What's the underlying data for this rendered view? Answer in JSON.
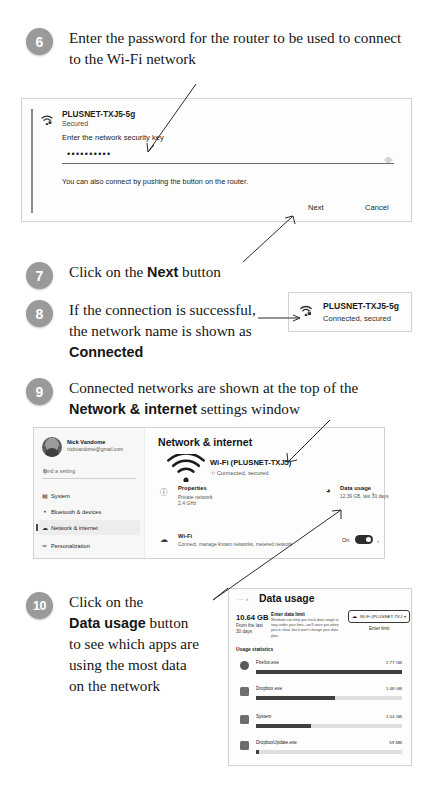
{
  "steps": [
    {
      "num": "6",
      "html_parts": [
        "Enter the password for the router to be used to connect to the Wi-Fi network"
      ]
    },
    {
      "num": "7",
      "pre": "Click on the ",
      "bold": "Next",
      "post": " button"
    },
    {
      "num": "8",
      "line1": "If the connection is successful,",
      "line2": "the network name is shown as",
      "bold": "Connected"
    },
    {
      "num": "9",
      "pre": "Connected networks are shown at the top of the ",
      "bold": "Network & internet",
      "post": " settings window"
    },
    {
      "num": "10",
      "l1": "Click on the",
      "bold": "Data usage",
      "boldpost": " button",
      "l3": "to see which apps are",
      "l4": "using the most data",
      "l5": "on the network"
    }
  ],
  "wifi_password_dialog": {
    "ssid": "PLUSNET-TXJ5-5g",
    "security": "Secured",
    "prompt": "Enter the network security key",
    "password_masked": "••••••••••",
    "reveal_icon": "eye-icon",
    "hint": "You can also connect by pushing the button on the router.",
    "next_label": "Next",
    "cancel_label": "Cancel"
  },
  "connected_chip": {
    "ssid": "PLUSNET-TXJ5-5g",
    "status": "Connected, secured"
  },
  "settings_window": {
    "account": {
      "name": "Nick Vandome",
      "email": "nickvandome@gmail.com"
    },
    "search_placeholder": "Find a setting",
    "nav": [
      {
        "label": "System",
        "icon": "monitor-icon",
        "selected": false
      },
      {
        "label": "Bluetooth & devices",
        "icon": "bluetooth-icon",
        "selected": false
      },
      {
        "label": "Network & internet",
        "icon": "wifi-icon",
        "selected": true
      },
      {
        "label": "Personalization",
        "icon": "brush-icon",
        "selected": false
      }
    ],
    "title": "Network & internet",
    "network": {
      "name": "Wi-Fi (PLUSNET-TXJ5)",
      "status": "Connected, secured"
    },
    "properties": {
      "title": "Properties",
      "line1": "Private network",
      "line2": "2.4 GHz",
      "chevron": "›"
    },
    "data_usage": {
      "title": "Data usage",
      "subtitle": "12.39 GB, last 30 days",
      "chevron": "›"
    },
    "wifi_row": {
      "title": "Wi-Fi",
      "subtitle": "Connect, manage known networks, metered network",
      "toggle_label": "On",
      "toggle_state": "on",
      "chevron": "›"
    }
  },
  "data_usage_window": {
    "breadcrumb": "···  ›",
    "title": "Data usage",
    "total": "10.64 GB",
    "period_line1": "From the last",
    "period_line2": "30 days",
    "limit_title": "Enter data limit",
    "limit_text": "Windows can help you track data usage to stay under your limit—we'll warn you when you're close, but it won't change your data plan.",
    "adapter_dropdown": "Wi-Fi (PLUSNET-TXJ",
    "adapter_icon": "wifi-icon",
    "enter_limit_label": "Enter limit",
    "usage_header": "Usage statistics",
    "apps": [
      {
        "name": "Firefox.exe",
        "value": "2.77 GB",
        "pct": 100,
        "icon": "firefox-icon"
      },
      {
        "name": "Dropbox.exe",
        "value": "1.48 GB",
        "pct": 54,
        "icon": "dropbox-icon"
      },
      {
        "name": "System",
        "value": "1.04 GB",
        "pct": 38,
        "icon": "system-icon"
      },
      {
        "name": "DropboxUpdate.exe",
        "value": "59 MB",
        "pct": 2,
        "icon": "dropbox-icon"
      }
    ]
  },
  "colors": {
    "badge": "#9a9a9a",
    "panel_border": "#d2d2d2",
    "bar_fill": "#3f3f3f",
    "bar_track": "#dedede"
  }
}
